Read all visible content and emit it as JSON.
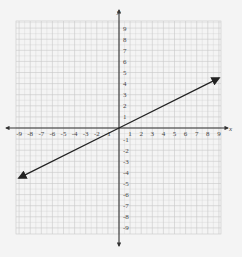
{
  "chart_data": {
    "type": "line",
    "title": "",
    "xlabel": "x",
    "ylabel": "y",
    "xlim": [
      -9.4,
      9.2
    ],
    "ylim": [
      -9.6,
      9.7
    ],
    "grid": true,
    "x_ticks": [
      -9,
      -8,
      -7,
      -6,
      -5,
      -4,
      -3,
      -2,
      -1,
      1,
      2,
      3,
      4,
      5,
      6,
      7,
      8,
      9
    ],
    "y_ticks": [
      9,
      8,
      7,
      6,
      5,
      4,
      3,
      2,
      1,
      -1,
      -2,
      -3,
      -4,
      -5,
      -6,
      -7,
      -8,
      -9
    ],
    "x_tick_labels": [
      "-9",
      "-8",
      "-7",
      "-6",
      "-5",
      "-4",
      "-3",
      "-2",
      "-1",
      "1",
      "2",
      "3",
      "4",
      "5",
      "6",
      "7",
      "8",
      "9"
    ],
    "y_tick_labels": [
      "9",
      "8",
      "7",
      "6",
      "5",
      "4",
      "3",
      "2",
      "1",
      "-1",
      "-2",
      "-3",
      "-4",
      "-5",
      "-6",
      "-7",
      "-8",
      "-9"
    ],
    "series": [
      {
        "name": "line",
        "equation": "y = x/2",
        "x": [
          -9,
          0,
          9
        ],
        "y": [
          -4.5,
          0,
          4.5
        ],
        "arrows": "both",
        "color": "#222222"
      }
    ]
  },
  "axes": {
    "x_label": "x",
    "y_label": "y"
  },
  "colors": {
    "grid": "#c8c8c8",
    "axis": "#333333",
    "line": "#222222",
    "background": "#f4f4f4"
  }
}
